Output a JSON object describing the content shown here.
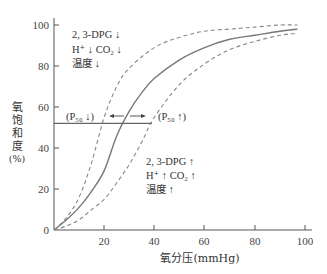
{
  "chart_data": {
    "type": "line",
    "title": "",
    "xlabel": "氧分压(mmHg)",
    "ylabel": "氧饱和度(%)",
    "ylabel_lines": [
      "氧",
      "饱",
      "和",
      "度",
      "(%)"
    ],
    "xlim": [
      0,
      100
    ],
    "ylim": [
      0,
      100
    ],
    "x_ticks": [
      20,
      40,
      60,
      80,
      100
    ],
    "y_ticks": [
      0,
      20,
      40,
      60,
      80,
      100
    ],
    "grid": false,
    "series": [
      {
        "name": "normal",
        "style": "solid",
        "x": [
          0,
          5,
          10,
          15,
          20,
          25,
          30,
          35,
          40,
          50,
          60,
          70,
          80,
          90,
          97
        ],
        "y": [
          0,
          5,
          11,
          19,
          29,
          46,
          58,
          67,
          74,
          83,
          89,
          93,
          95,
          97,
          98
        ]
      },
      {
        "name": "left-shift (P50↓)",
        "style": "dashed",
        "x": [
          0,
          5,
          10,
          15,
          20,
          25,
          30,
          40,
          50,
          60,
          70,
          80,
          90,
          97
        ],
        "y": [
          0,
          6,
          16,
          33,
          55,
          70,
          79,
          89,
          94,
          97,
          98,
          99,
          100,
          100
        ]
      },
      {
        "name": "right-shift (P50↑)",
        "style": "dashed",
        "x": [
          0,
          5,
          10,
          15,
          20,
          25,
          30,
          35,
          40,
          50,
          60,
          70,
          80,
          90,
          97
        ],
        "y": [
          0,
          2,
          5,
          10,
          15,
          23,
          32,
          43,
          55,
          71,
          81,
          88,
          92,
          95,
          96
        ]
      }
    ],
    "reference_line": {
      "y": 52,
      "x_from": 0,
      "x_to": 39
    },
    "annotations": {
      "left_group": [
        "2, 3-DPG ↓",
        "H⁺ ↓ CO₂ ↓",
        "温度 ↓"
      ],
      "right_group": [
        "2, 3-DPG ↑",
        "H⁺ ↑ CO₂ ↑",
        "温度 ↑"
      ],
      "p50_left": "(P₅₀ ↓)",
      "p50_right": "(P₅₀ ↑)",
      "arrow_left": "←",
      "arrow_right": "→"
    },
    "colors": {
      "axis": "#555555",
      "curve": "#777777",
      "dashed": "#888888",
      "text": "#333333"
    }
  }
}
